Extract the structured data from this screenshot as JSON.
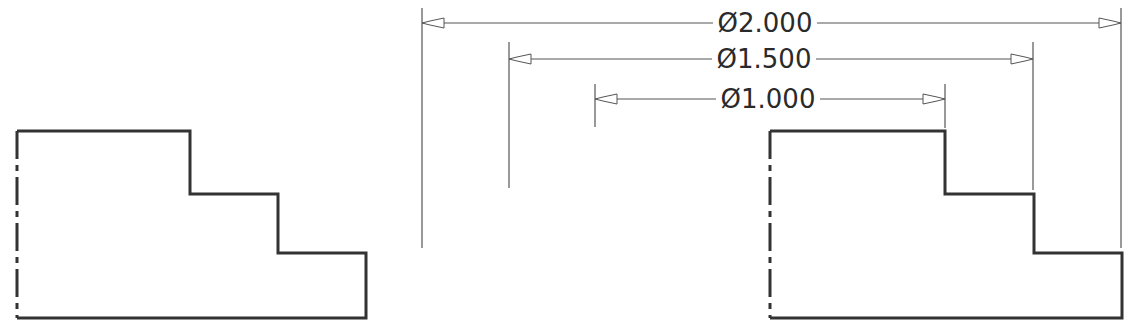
{
  "colors": {
    "line": "#333333",
    "thin": "#555555",
    "text": "#2a2a2a",
    "background": "#ffffff"
  },
  "left_profile": {
    "label": "stepped-profile-undimensioned",
    "points": "17,131 190,131 190,194 278,194 278,253 366,253 366,318 17,318",
    "centerline": {
      "x": 17,
      "y1": 131,
      "y2": 318
    }
  },
  "right_profile": {
    "label": "stepped-profile-dimensioned",
    "points": "770,131 945,131 945,194 1034,194 1034,253 1122,253 1122,318 770,318",
    "centerline": {
      "x": 770,
      "y1": 131,
      "y2": 318
    }
  },
  "dimensions": [
    {
      "text": "Ø2.000",
      "y": 23,
      "x1": 422,
      "x2": 1121,
      "ext_top": 8,
      "ext_left_bottom": 248,
      "ext_right_bottom": 248,
      "text_x": 765
    },
    {
      "text": "Ø1.500",
      "y": 59,
      "x1": 509,
      "x2": 1033,
      "ext_top": 42,
      "ext_left_bottom": 188,
      "ext_right_bottom": 190,
      "text_x": 764
    },
    {
      "text": "Ø1.000",
      "y": 99,
      "x1": 595,
      "x2": 945,
      "ext_top": 84,
      "ext_left_bottom": 127,
      "ext_right_bottom": 128,
      "text_x": 768
    }
  ]
}
